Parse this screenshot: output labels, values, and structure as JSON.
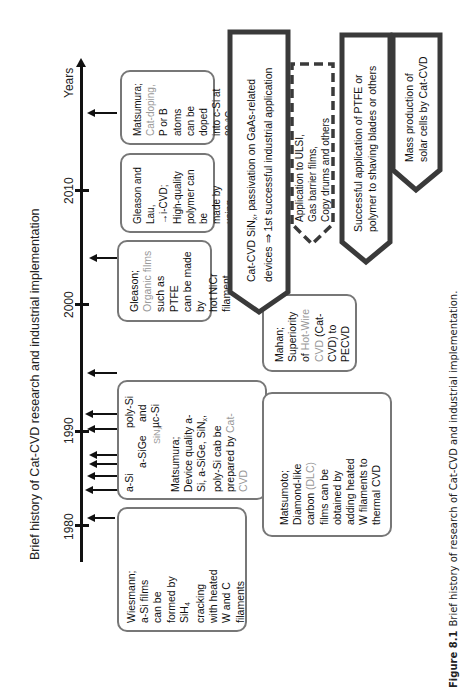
{
  "figure": {
    "title": "Brief history of Cat-CVD research and industrial implementation",
    "axis_label": "Years",
    "years": [
      "1980",
      "1990",
      "2000",
      "2010"
    ],
    "caption_label": "Figure 8.1",
    "caption_text": "Brief history of research of Cat-CVD and industrial implementation."
  },
  "events": {
    "wiesmann": {
      "lines": [
        "Wiesmann;",
        "a-Si films",
        "can be",
        "formed by",
        "SiH",
        "cracking",
        "with heated",
        "W and C",
        "filaments"
      ],
      "sub": "4"
    },
    "matsumura_device": {
      "film_labels": [
        "a-Si",
        "a-SiGe",
        "poly-Si",
        "and",
        "µc-Si",
        "SiN"
      ],
      "sub": "x",
      "lines": [
        "Matsumura;",
        "Device quality a-",
        "Si, a-SiGe, SiN",
        ",",
        "poly-Si cab be",
        "prepared by",
        "Cat-",
        "CVD"
      ]
    },
    "matsumoto": {
      "lines": [
        "Matsumoto;",
        "Diamond-like",
        "carbon",
        "(DLC)",
        "films can be",
        "obtained by",
        "adding heated",
        "W filaments to",
        "thermal CVD"
      ]
    },
    "mahan": {
      "lines": [
        "Mahan;",
        "Superiority",
        "of",
        "Hot-Wire",
        "CVD",
        "(Cat-",
        "CVD) to",
        "PECVD"
      ]
    },
    "gleason": {
      "lines": [
        "Gleason;",
        "Organic films",
        "such as PTFE",
        "can be made by",
        "hot NiCr",
        "filament"
      ]
    },
    "gleason_lau": {
      "lines": [
        "Gleason and Lau,",
        "→i-CVD;",
        "High-quality",
        "polymer can be",
        "made by using",
        "cracked initiator"
      ]
    },
    "matsumura_doping": {
      "lines": [
        "Matsumura;",
        "Cat-doping,",
        "P or B atoms",
        "can be doped",
        "into c-Si at",
        "80 °C"
      ]
    }
  },
  "applications": [
    {
      "lines": [
        "Cat-CVD SiN",
        "x",
        ", passivation on GaAs-related",
        "devices ⇒ 1st successful industrial application"
      ],
      "style": "solid"
    },
    {
      "lines": [
        "Application to ULSI,",
        "Gas barrier films,",
        "Copy drums and others"
      ],
      "style": "dashed"
    },
    {
      "lines": [
        "Successful application of PTFE or",
        "polymer to shaving blades or others"
      ],
      "style": "solid"
    },
    {
      "lines": [
        "Mass production of",
        "solar cells by Cat-CVD"
      ],
      "style": "solid"
    }
  ],
  "colors": {
    "axis": "#111111",
    "box_border": "#777777",
    "highlight_text": "#999999",
    "arrow_border": "#3a3a3a"
  }
}
